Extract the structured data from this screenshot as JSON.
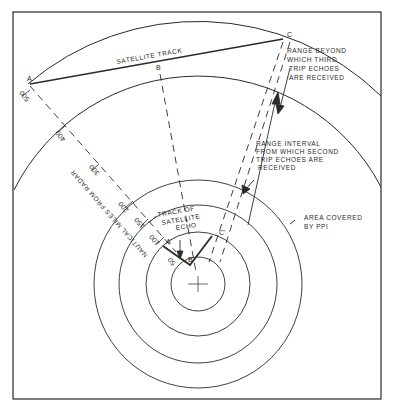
{
  "diagram": {
    "points": {
      "A": "A",
      "B": "B",
      "C": "C",
      "A_prime": "A'",
      "B_prime": "B'",
      "C_prime": "C'"
    },
    "labels": {
      "satellite_track": "SATELLITE TRACK",
      "range_beyond_1": "RANGE BEYOND",
      "range_beyond_2": "WHICH THIRD",
      "range_beyond_3": "TRIP ECHOES",
      "range_beyond_4": "ARE RECEIVED",
      "range_interval_1": "RANGE INTERVAL",
      "range_interval_2": "FROM WHICH SECOND",
      "range_interval_3": "TRIP ECHOES ARE",
      "range_interval_4": "RECEIVED",
      "area_covered_1": "AREA COVERED",
      "area_covered_2": "BY PPI",
      "track_of_echo_1": "TRACK OF",
      "track_of_echo_2": "SATELLITE",
      "track_of_echo_3": "ECHO",
      "axis_label": "NAUTICAL MILES FROM RADAR"
    },
    "scale_ticks": [
      "500",
      "400",
      "300",
      "200",
      "150",
      "100",
      "50"
    ],
    "colors": {
      "ink": "#2a2a2a",
      "background": "#ffffff"
    }
  }
}
